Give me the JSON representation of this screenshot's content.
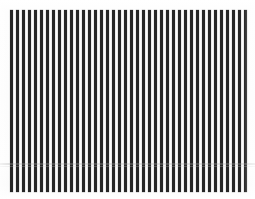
{
  "image": {
    "kind": "vertical-stripe-test-pattern",
    "width": 255,
    "height": 199,
    "background_color": "#fdfdfd",
    "caption": ""
  },
  "pattern": {
    "orientation": "vertical",
    "stripe_color": "#262626",
    "gap_color": "#fdfdfd",
    "stripe_count": 40,
    "stripe_width_px": 3,
    "period_px": 6,
    "field_left_px": 10,
    "field_top_px": 10,
    "field_width_px": 232,
    "field_height_px": 182
  },
  "artifacts": {
    "scan_seam_top_px": 163,
    "scan_seam_color": "#aaaaaa",
    "scan_seam_label": "faint horizontal scan seam"
  },
  "chart_data": {
    "type": "bar",
    "title": "",
    "subtitle": "",
    "xlabel": "",
    "ylabel": "",
    "grid": false,
    "legend": null,
    "categories": [
      "1",
      "2",
      "3",
      "4",
      "5",
      "6",
      "7",
      "8",
      "9",
      "10",
      "11",
      "12",
      "13",
      "14",
      "15",
      "16",
      "17",
      "18",
      "19",
      "20",
      "21",
      "22",
      "23",
      "24",
      "25",
      "26",
      "27",
      "28",
      "29",
      "30",
      "31",
      "32",
      "33",
      "34",
      "35",
      "36",
      "37",
      "38",
      "39",
      "40"
    ],
    "values": [
      1,
      1,
      1,
      1,
      1,
      1,
      1,
      1,
      1,
      1,
      1,
      1,
      1,
      1,
      1,
      1,
      1,
      1,
      1,
      1,
      1,
      1,
      1,
      1,
      1,
      1,
      1,
      1,
      1,
      1,
      1,
      1,
      1,
      1,
      1,
      1,
      1,
      1,
      1,
      1
    ],
    "ylim": [
      0,
      1
    ],
    "bar_color": "#262626",
    "bar_width_px": 3,
    "bar_gap_px": 3
  }
}
